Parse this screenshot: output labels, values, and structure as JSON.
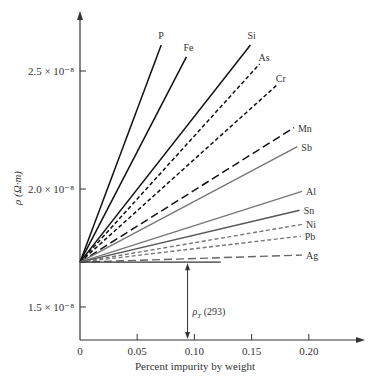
{
  "chart_data": {
    "type": "line",
    "title": "",
    "xlabel": "Percent impurity by weight",
    "ylabel": "ρ (Ω·m)",
    "x_ticks": [
      "0",
      "0.05",
      "0.10",
      "0.15",
      "0.20"
    ],
    "x_tick_values": [
      0,
      0.05,
      0.1,
      0.15,
      0.2
    ],
    "y_ticks": [
      "1.5 × 10⁻⁸",
      "2.0 × 10⁻⁸",
      "2.5 × 10⁻⁸"
    ],
    "y_tick_values": [
      1.5,
      2.0,
      2.5
    ],
    "y_unit_scale": "1e-8",
    "xlim": [
      0,
      0.24
    ],
    "ylim": [
      1.35,
      2.8
    ],
    "grid": false,
    "legend": "inline labels at line ends",
    "base_value": 1.69,
    "annotation": {
      "label": "ρT (293)",
      "x": 0.094,
      "from": 1.32,
      "to": 1.69,
      "base_line_end_x": 0.123
    },
    "series": [
      {
        "name": "P",
        "style": "solid",
        "color": "#111111",
        "x": [
          0,
          0.071
        ],
        "values": [
          1.69,
          2.61
        ]
      },
      {
        "name": "Fe",
        "style": "solid",
        "color": "#111111",
        "x": [
          0,
          0.093
        ],
        "values": [
          1.69,
          2.56
        ]
      },
      {
        "name": "Si",
        "style": "solid",
        "color": "#111111",
        "x": [
          0,
          0.149
        ],
        "values": [
          1.69,
          2.61
        ]
      },
      {
        "name": "As",
        "style": "dashed",
        "color": "#111111",
        "x": [
          0,
          0.157
        ],
        "values": [
          1.69,
          2.53
        ]
      },
      {
        "name": "Cr",
        "style": "dashed",
        "color": "#111111",
        "x": [
          0,
          0.172
        ],
        "values": [
          1.69,
          2.44
        ]
      },
      {
        "name": "Mn",
        "style": "long-dashed",
        "color": "#111111",
        "x": [
          0,
          0.187
        ],
        "values": [
          1.69,
          2.26
        ]
      },
      {
        "name": "Sb",
        "style": "solid",
        "color": "#777777",
        "x": [
          0,
          0.19
        ],
        "values": [
          1.69,
          2.18
        ]
      },
      {
        "name": "Al",
        "style": "solid",
        "color": "#777777",
        "x": [
          0,
          0.194
        ],
        "values": [
          1.69,
          1.99
        ]
      },
      {
        "name": "Sn",
        "style": "solid",
        "color": "#555555",
        "x": [
          0,
          0.192
        ],
        "values": [
          1.69,
          1.91
        ]
      },
      {
        "name": "Ni",
        "style": "dashed",
        "color": "#777777",
        "x": [
          0,
          0.194
        ],
        "values": [
          1.69,
          1.85
        ]
      },
      {
        "name": "Pb",
        "style": "dashed",
        "color": "#777777",
        "x": [
          0,
          0.193
        ],
        "values": [
          1.69,
          1.8
        ]
      },
      {
        "name": "Ag",
        "style": "long-dashed",
        "color": "#666666",
        "x": [
          0,
          0.194
        ],
        "values": [
          1.69,
          1.72
        ]
      }
    ]
  }
}
